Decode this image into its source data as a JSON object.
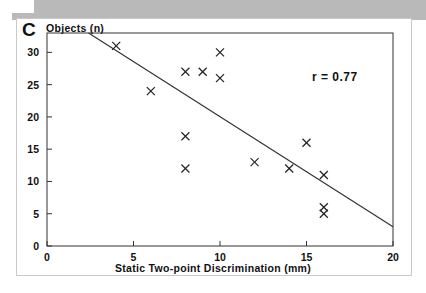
{
  "figure": {
    "panel_letter": "C",
    "annotation": "r = 0.77"
  },
  "chart_data": {
    "type": "scatter",
    "title": "",
    "subtitle": "",
    "xlabel": "Static Two-point Discrimination (mm)",
    "ylabel": "Objects (n)",
    "xlim": [
      0,
      20
    ],
    "ylim": [
      0,
      33
    ],
    "xticks": [
      0,
      5,
      10,
      15,
      20
    ],
    "xtick_labels": [
      "0",
      "5",
      "10",
      "15",
      "20"
    ],
    "yticks": [
      0,
      5,
      10,
      15,
      20,
      25,
      30
    ],
    "ytick_labels": [
      "0",
      "5",
      "10",
      "15",
      "20",
      "25",
      "30"
    ],
    "grid": false,
    "legend": false,
    "marker": "x",
    "marker_color": "#222222",
    "series": [
      {
        "name": "subjects",
        "x": [
          4,
          6,
          8,
          8,
          8,
          9,
          10,
          10,
          12,
          14,
          15,
          16,
          16,
          16
        ],
        "y": [
          31,
          24,
          27,
          17,
          12,
          27,
          30,
          26,
          13,
          12,
          16,
          11,
          6,
          5
        ]
      }
    ],
    "trendline": {
      "type": "linear",
      "x": [
        2.4,
        20.0
      ],
      "y": [
        33.0,
        3.0
      ],
      "color": "#333333"
    },
    "annotations": [
      {
        "text": "r = 0.77",
        "x": 15.6,
        "y": 24.5
      }
    ],
    "correlation_r": 0.77
  },
  "colors": {
    "banner": "#b9b9b9",
    "axis": "#333333",
    "text": "#111111",
    "frame": "#c9c9c9",
    "background": "#ffffff"
  }
}
